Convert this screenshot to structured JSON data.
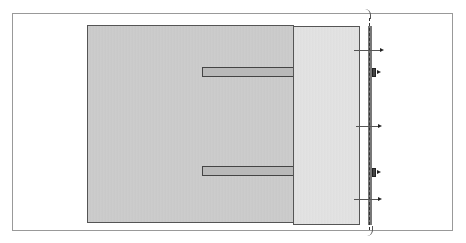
{
  "diagram": {
    "caption_partial": "",
    "components": [
      {
        "id": "outer-frame",
        "type": "frame"
      },
      {
        "id": "main-block",
        "type": "shaded-rectangle"
      },
      {
        "id": "side-panel",
        "type": "shaded-rectangle"
      },
      {
        "id": "upper-bar",
        "type": "horizontal-bar"
      },
      {
        "id": "lower-bar",
        "type": "horizontal-bar"
      },
      {
        "id": "dashed-line",
        "type": "dashed-reference-line"
      },
      {
        "id": "edge-markers",
        "type": "arrow-markers",
        "count": 3
      },
      {
        "id": "clips",
        "type": "edge-clips",
        "count": 2
      }
    ],
    "colors": {
      "main_block": "#c9c9c9",
      "side_panel": "#e0e0e0",
      "bars": "#b9b9b9",
      "outline": "#555555"
    }
  }
}
